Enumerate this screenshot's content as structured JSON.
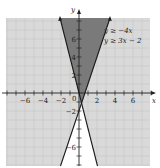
{
  "graph": {
    "x_axis_label": "x",
    "y_axis_label": "y",
    "origin_label": "0",
    "x_ticks": [
      {
        "label": "−6",
        "value": -6
      },
      {
        "label": "−4",
        "value": -4
      },
      {
        "label": "−2",
        "value": -2
      },
      {
        "label": "2",
        "value": 2
      },
      {
        "label": "4",
        "value": 4
      },
      {
        "label": "6",
        "value": 6
      }
    ],
    "y_ticks": [
      {
        "label": "6",
        "value": 6
      },
      {
        "label": "4",
        "value": 4
      },
      {
        "label": "2",
        "value": 2
      },
      {
        "label": "−2",
        "value": -2
      },
      {
        "label": "−6",
        "value": -6
      }
    ],
    "inequalities": [
      {
        "text": "y ≥ −4x"
      },
      {
        "text": "y ≥ 3x − 2"
      }
    ],
    "colors": {
      "grid_background": "#d9d9d9",
      "grid_lines": "#c4c4c4",
      "solution_region": "#7a7a7a",
      "unshaded_region": "#ffffff",
      "boundary_lines": "#1a1a1a"
    }
  },
  "chart_data": {
    "type": "line",
    "title": "",
    "xlabel": "x",
    "ylabel": "y",
    "xlim": [
      -8,
      8
    ],
    "ylim": [
      -8,
      8
    ],
    "grid": true,
    "series": [
      {
        "name": "y = -4x",
        "slope": -4,
        "intercept": 0,
        "inequality": "y ≥ −4x"
      },
      {
        "name": "y = 3x - 2",
        "slope": 3,
        "intercept": -2,
        "inequality": "y ≥ 3x − 2"
      }
    ],
    "intersection": {
      "x": 0.286,
      "y": -1.143
    },
    "shaded_region": "above both lines (y ≥ −4x and y ≥ 3x − 2)",
    "legend_position": "upper right"
  }
}
